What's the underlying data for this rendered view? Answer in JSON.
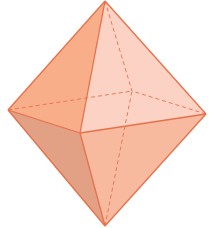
{
  "diagram": {
    "type": "octahedron",
    "title": "",
    "colors": {
      "background": "#ffffff",
      "edge": "#E8704A",
      "face_top_left": "#F9AE8A",
      "face_top_right": "#FBD2C3",
      "face_bottom_left": "#E2A084",
      "face_bottom_right": "#F8BA9F"
    },
    "vertices": {
      "top": [
        105,
        1
      ],
      "left": [
        8,
        110
      ],
      "right": [
        206,
        114
      ],
      "front": [
        80,
        133
      ],
      "back": [
        132,
        91
      ],
      "bottom": [
        105,
        226
      ]
    },
    "visible_edges": [
      [
        "top",
        "left"
      ],
      [
        "top",
        "right"
      ],
      [
        "top",
        "front"
      ],
      [
        "left",
        "front"
      ],
      [
        "front",
        "right"
      ],
      [
        "bottom",
        "left"
      ],
      [
        "bottom",
        "right"
      ],
      [
        "bottom",
        "front"
      ]
    ],
    "hidden_edges": [
      [
        "top",
        "back"
      ],
      [
        "left",
        "back"
      ],
      [
        "right",
        "back"
      ],
      [
        "bottom",
        "back"
      ]
    ]
  }
}
